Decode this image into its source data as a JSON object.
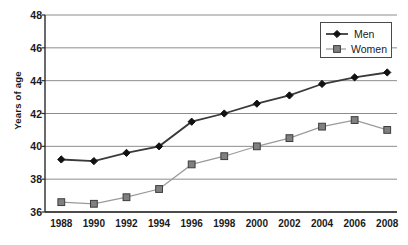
{
  "chart_data": {
    "type": "line",
    "title": "",
    "xlabel": "",
    "ylabel": "Years of age",
    "categories": [
      "1988",
      "1990",
      "1992",
      "1994",
      "1996",
      "1998",
      "2000",
      "2002",
      "2004",
      "2006",
      "2008"
    ],
    "x": [
      1988,
      1990,
      1992,
      1994,
      1996,
      1998,
      2000,
      2002,
      2004,
      2006,
      2008
    ],
    "xlim": [
      1987,
      2008.6
    ],
    "ylim": [
      36,
      48
    ],
    "yticks": [
      36,
      38,
      40,
      42,
      44,
      46,
      48
    ],
    "ytick_labels": [
      "36",
      "38",
      "40",
      "42",
      "44",
      "46",
      "48"
    ],
    "grid": "horizontal",
    "legend_position": "top-right",
    "series": [
      {
        "name": "Men",
        "marker": "diamond",
        "color": "#111111",
        "line_color": "#3a3a3a",
        "values": [
          39.2,
          39.1,
          39.6,
          40.0,
          41.5,
          42.0,
          42.6,
          43.1,
          43.8,
          44.2,
          44.5
        ]
      },
      {
        "name": "Women",
        "marker": "square",
        "color": "#808080",
        "line_color": "#9a9a9a",
        "values": [
          36.6,
          36.5,
          36.9,
          37.4,
          38.9,
          39.4,
          40.0,
          40.5,
          41.2,
          41.6,
          41.0
        ]
      }
    ]
  },
  "legend": {
    "items": [
      {
        "label": "Men"
      },
      {
        "label": "Women"
      }
    ]
  },
  "colors": {
    "men": "#111111",
    "women": "#808080",
    "grid": "#8c8c8c",
    "axis": "#2b2b2b",
    "background": "#ffffff"
  }
}
